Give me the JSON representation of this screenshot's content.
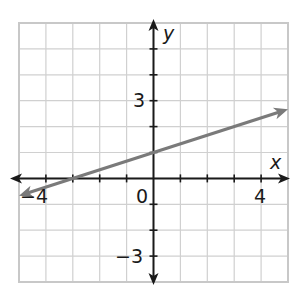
{
  "header": {
    "cropped_text_fragment": ""
  },
  "chart_data": {
    "type": "line",
    "title": "",
    "xlabel": "x",
    "ylabel": "y",
    "xlim": [
      -5,
      5
    ],
    "ylim": [
      -4,
      6
    ],
    "grid": true,
    "x_tick_labels": [
      {
        "value": -4,
        "label": "−4"
      },
      {
        "value": 0,
        "label": "0"
      },
      {
        "value": 4,
        "label": "4"
      }
    ],
    "y_tick_labels": [
      {
        "value": 3,
        "label": "3"
      },
      {
        "value": -3,
        "label": "−3"
      }
    ],
    "series": [
      {
        "name": "line",
        "equation": "y = (1/3)x + 1",
        "slope": 0.3333,
        "intercept": 1,
        "x_intercept": -3,
        "x": [
          -5,
          -3,
          0,
          3,
          5
        ],
        "y": [
          -0.67,
          0,
          1,
          2,
          2.67
        ],
        "arrows": "both",
        "color": "#7a7a7a"
      }
    ],
    "colors": {
      "grid": "#d0d0d0",
      "axis": "#1a1a1a",
      "line": "#7a7a7a",
      "border": "#c8c8c8"
    }
  }
}
